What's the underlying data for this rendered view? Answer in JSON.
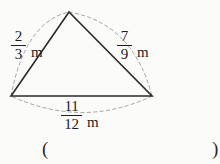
{
  "figure": {
    "background_color": "#fbfbfa",
    "stroke_color": "#2b2b2b",
    "dash_color": "#9a9a9a",
    "unit": "m",
    "triangle": {
      "apex": {
        "x": 69,
        "y": 12
      },
      "left_vertex": {
        "x": 11,
        "y": 96
      },
      "right_vertex": {
        "x": 152,
        "y": 96
      }
    },
    "sides": [
      {
        "id": "left",
        "position": "left",
        "numerator": "2",
        "denominator": "3",
        "unit": "m",
        "value": 0.6667
      },
      {
        "id": "right",
        "position": "right",
        "numerator": "7",
        "denominator": "9",
        "unit": "m",
        "value": 0.7778
      },
      {
        "id": "bottom",
        "position": "bottom",
        "numerator": "11",
        "denominator": "12",
        "unit": "m",
        "value": 0.9167
      }
    ]
  },
  "answer": {
    "paren_open": "(",
    "paren_close": ")",
    "value": ""
  }
}
